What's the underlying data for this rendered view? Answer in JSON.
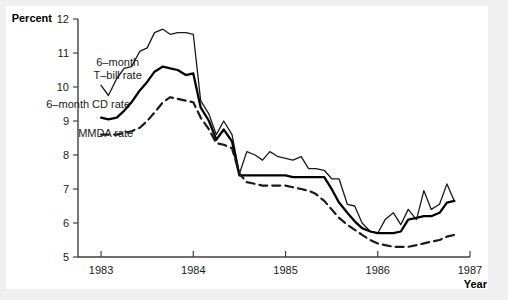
{
  "chart_data": {
    "type": "line",
    "title": "",
    "subtitle": "",
    "xlabel": "Year",
    "ylabel": "Percent",
    "xlim": [
      1982.75,
      1987.0
    ],
    "ylim": [
      5,
      12
    ],
    "grid": false,
    "legend_position": "inline-annotations",
    "xticks": [
      1983,
      1984,
      1985,
      1986,
      1987
    ],
    "xticklabels": [
      "1983",
      "1984",
      "1985",
      "1986",
      "1987"
    ],
    "yticks": [
      5,
      6,
      7,
      8,
      9,
      10,
      11,
      12
    ],
    "yticklabels": [
      "5",
      "6",
      "7",
      "8",
      "9",
      "10",
      "11",
      "12"
    ],
    "annotations": [
      {
        "text": "6–month",
        "x": 1983.18,
        "y": 10.62
      },
      {
        "text": "T–bill rate",
        "x": 1983.18,
        "y": 10.25
      },
      {
        "text": "6–month CD rate",
        "x": 1982.86,
        "y": 9.38
      },
      {
        "text": "MMDA rate",
        "x": 1983.05,
        "y": 8.52
      }
    ],
    "series": [
      {
        "name": "6-month T-bill rate",
        "style": "solid-thin",
        "color": "#1a1a1a",
        "width": 1.3,
        "x": [
          1983.0,
          1983.08,
          1983.17,
          1983.25,
          1983.33,
          1983.42,
          1983.5,
          1983.58,
          1983.67,
          1983.75,
          1983.83,
          1983.92,
          1984.0,
          1984.08,
          1984.17,
          1984.25,
          1984.33,
          1984.42,
          1984.5,
          1984.58,
          1984.67,
          1984.75,
          1984.83,
          1984.92,
          1985.0,
          1985.08,
          1985.17,
          1985.25,
          1985.33,
          1985.42,
          1985.5,
          1985.58,
          1985.67,
          1985.75,
          1985.83,
          1985.92,
          1986.0,
          1986.08,
          1986.17,
          1986.25,
          1986.33,
          1986.42,
          1986.5,
          1986.58,
          1986.67,
          1986.75,
          1986.83
        ],
        "y": [
          10.05,
          9.75,
          10.25,
          10.55,
          10.6,
          11.05,
          11.15,
          11.6,
          11.7,
          11.55,
          11.6,
          11.6,
          11.55,
          9.6,
          9.2,
          8.6,
          9.0,
          8.6,
          7.45,
          8.1,
          8.0,
          7.85,
          8.1,
          7.95,
          7.9,
          7.85,
          7.95,
          7.6,
          7.6,
          7.55,
          7.3,
          7.3,
          6.55,
          6.5,
          6.0,
          5.75,
          5.7,
          6.1,
          6.3,
          5.95,
          6.4,
          6.1,
          6.95,
          6.4,
          6.55,
          7.15,
          6.65
        ]
      },
      {
        "name": "6-month CD rate",
        "style": "solid-thick",
        "color": "#000000",
        "width": 2.3,
        "x": [
          1983.0,
          1983.08,
          1983.17,
          1983.25,
          1983.33,
          1983.42,
          1983.5,
          1983.58,
          1983.67,
          1983.75,
          1983.83,
          1983.92,
          1984.0,
          1984.08,
          1984.17,
          1984.25,
          1984.33,
          1984.42,
          1984.5,
          1984.58,
          1984.67,
          1984.75,
          1984.83,
          1984.92,
          1985.0,
          1985.08,
          1985.17,
          1985.25,
          1985.33,
          1985.42,
          1985.5,
          1985.58,
          1985.67,
          1985.75,
          1985.83,
          1985.92,
          1986.0,
          1986.08,
          1986.17,
          1986.25,
          1986.33,
          1986.42,
          1986.5,
          1986.58,
          1986.67,
          1986.75,
          1986.83
        ],
        "y": [
          9.1,
          9.05,
          9.1,
          9.3,
          9.55,
          9.9,
          10.15,
          10.45,
          10.6,
          10.55,
          10.5,
          10.35,
          10.4,
          9.4,
          9.0,
          8.45,
          8.75,
          8.4,
          7.4,
          7.4,
          7.4,
          7.4,
          7.4,
          7.4,
          7.4,
          7.35,
          7.35,
          7.35,
          7.35,
          7.35,
          7.0,
          6.6,
          6.3,
          6.05,
          5.85,
          5.75,
          5.7,
          5.7,
          5.7,
          5.75,
          6.1,
          6.15,
          6.2,
          6.2,
          6.3,
          6.6,
          6.65
        ]
      },
      {
        "name": "MMDA rate",
        "style": "dashed",
        "color": "#1a1a1a",
        "width": 2.2,
        "x": [
          1983.0,
          1983.08,
          1983.17,
          1983.25,
          1983.33,
          1983.42,
          1983.5,
          1983.58,
          1983.67,
          1983.75,
          1983.83,
          1983.92,
          1984.0,
          1984.08,
          1984.17,
          1984.25,
          1984.33,
          1984.42,
          1984.5,
          1984.58,
          1984.67,
          1984.75,
          1984.83,
          1984.92,
          1985.0,
          1985.08,
          1985.17,
          1985.25,
          1985.33,
          1985.42,
          1985.5,
          1985.58,
          1985.67,
          1985.75,
          1985.83,
          1985.92,
          1986.0,
          1986.08,
          1986.17,
          1986.25,
          1986.33,
          1986.42,
          1986.5,
          1986.58,
          1986.67,
          1986.75,
          1986.83
        ],
        "y": [
          8.6,
          8.6,
          8.6,
          8.65,
          8.7,
          8.8,
          9.0,
          9.25,
          9.55,
          9.7,
          9.65,
          9.6,
          9.55,
          9.1,
          8.75,
          8.35,
          8.3,
          8.2,
          7.45,
          7.2,
          7.15,
          7.1,
          7.1,
          7.1,
          7.1,
          7.05,
          7.0,
          6.95,
          6.85,
          6.65,
          6.4,
          6.15,
          5.95,
          5.8,
          5.65,
          5.5,
          5.4,
          5.35,
          5.3,
          5.3,
          5.3,
          5.35,
          5.4,
          5.45,
          5.5,
          5.6,
          5.65
        ]
      }
    ]
  },
  "axes": {
    "y_axis_title": "Percent",
    "x_axis_title": "Year"
  },
  "colors": {
    "background": "#f0f0f0",
    "plot_background": "#ffffff",
    "axis": "#404040",
    "tbill": "#1a1a1a",
    "cd": "#000000",
    "mmda": "#1a1a1a"
  }
}
